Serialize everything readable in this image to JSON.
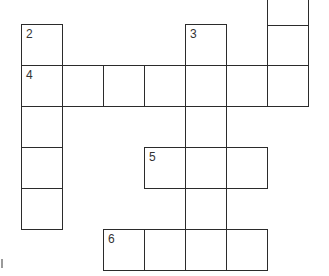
{
  "puzzle": {
    "type": "crossword",
    "cell_size": 41,
    "line_color": "#2b2b2b",
    "cells": [
      {
        "id": "r0c6a",
        "x": 267,
        "y": -15,
        "num": ""
      },
      {
        "id": "r0c6",
        "x": 267,
        "y": 25,
        "num": ""
      },
      {
        "id": "c2-0",
        "x": 21,
        "y": 24,
        "num": "2"
      },
      {
        "id": "c3-0",
        "x": 185,
        "y": 24,
        "num": "3"
      },
      {
        "id": "r4c0",
        "x": 21,
        "y": 65,
        "num": "4"
      },
      {
        "id": "r4c1",
        "x": 62,
        "y": 65,
        "num": ""
      },
      {
        "id": "r4c2",
        "x": 103,
        "y": 65,
        "num": ""
      },
      {
        "id": "r4c3",
        "x": 144,
        "y": 65,
        "num": ""
      },
      {
        "id": "r4c4",
        "x": 185,
        "y": 65,
        "num": ""
      },
      {
        "id": "r4c5",
        "x": 226,
        "y": 65,
        "num": ""
      },
      {
        "id": "r4c6",
        "x": 267,
        "y": 65,
        "num": ""
      },
      {
        "id": "r2c0",
        "x": 21,
        "y": 106,
        "num": ""
      },
      {
        "id": "r2c4",
        "x": 185,
        "y": 106,
        "num": ""
      },
      {
        "id": "r3c0",
        "x": 21,
        "y": 147,
        "num": ""
      },
      {
        "id": "r5c3",
        "x": 144,
        "y": 147,
        "num": "5"
      },
      {
        "id": "r5c4",
        "x": 185,
        "y": 147,
        "num": ""
      },
      {
        "id": "r5c5",
        "x": 226,
        "y": 147,
        "num": ""
      },
      {
        "id": "r4c0b",
        "x": 21,
        "y": 188,
        "num": ""
      },
      {
        "id": "r4c4b",
        "x": 185,
        "y": 188,
        "num": ""
      },
      {
        "id": "r6c2",
        "x": 103,
        "y": 229,
        "num": "6"
      },
      {
        "id": "r6c3",
        "x": 144,
        "y": 229,
        "num": ""
      },
      {
        "id": "r6c4",
        "x": 185,
        "y": 229,
        "num": ""
      },
      {
        "id": "r6c5",
        "x": 226,
        "y": 229,
        "num": ""
      }
    ],
    "clue_numbers": [
      "2",
      "3",
      "4",
      "5",
      "6"
    ]
  }
}
